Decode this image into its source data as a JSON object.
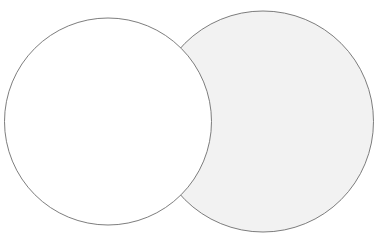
{
  "figure": {
    "type": "venn-two-set",
    "canvas": {
      "width": 380,
      "height": 247,
      "background_color": "#ffffff"
    },
    "shapes": [
      {
        "name": "right-circle",
        "label": "Right circle (shaded)",
        "cx": 263,
        "cy": 121.5,
        "r": 110.5,
        "fill_color": "#f2f2f2",
        "stroke_color": "#6e6e6e",
        "stroke_width": 0.9,
        "z_order": 1
      },
      {
        "name": "left-circle",
        "label": "Left circle (unshaded)",
        "cx": 108,
        "cy": 121.5,
        "r": 103.5,
        "fill_color": "#ffffff",
        "stroke_color": "#6e6e6e",
        "stroke_width": 0.9,
        "z_order": 2
      }
    ],
    "intersection_points": [
      {
        "name": "upper-intersection",
        "x": 196,
        "y": 42
      },
      {
        "name": "lower-intersection",
        "x": 196,
        "y": 201
      }
    ]
  }
}
